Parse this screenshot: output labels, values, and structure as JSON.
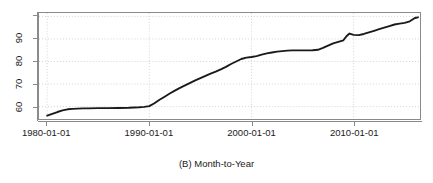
{
  "caption": "(B) Month-to-Year",
  "axis": {
    "y_ticks": [
      60,
      70,
      80,
      90
    ],
    "y_tick_labels": [
      "60",
      "70",
      "80",
      "90"
    ],
    "x_tick_labels": [
      "1980-01-01",
      "1990-01-01",
      "2000-01-01",
      "2010-01-01"
    ],
    "x_tick_values": [
      1980,
      1990,
      2000,
      2010
    ]
  },
  "chart_data": {
    "type": "line",
    "title": "",
    "subtitle": "",
    "xlabel": "(B) Month-to-Year",
    "ylabel": "",
    "grid": true,
    "legend": "none",
    "xlim": [
      1979.2,
      2016.5
    ],
    "ylim": [
      54.5,
      101.5
    ],
    "x_tick_labels": [
      "1980-01-01",
      "1990-01-01",
      "2000-01-01",
      "2010-01-01"
    ],
    "x_ticks": [
      1980,
      1990,
      2000,
      2010
    ],
    "y_ticks": [
      60,
      70,
      80,
      90
    ],
    "series": [
      {
        "name": "cumulative-percent",
        "color": "#1a1a1a",
        "x": [
          1980.0,
          1980.5,
          1981.0,
          1981.5,
          1982.0,
          1982.5,
          1983.0,
          1983.5,
          1984.0,
          1985.0,
          1986.0,
          1987.0,
          1988.0,
          1989.0,
          1989.5,
          1990.0,
          1990.5,
          1991.0,
          1991.5,
          1992.0,
          1992.5,
          1993.0,
          1993.5,
          1994.0,
          1994.5,
          1995.0,
          1995.5,
          1996.0,
          1996.5,
          1997.0,
          1997.5,
          1998.0,
          1998.5,
          1999.0,
          1999.5,
          2000.0,
          2000.5,
          2001.0,
          2001.5,
          2002.0,
          2002.5,
          2003.0,
          2003.5,
          2004.0,
          2004.5,
          2005.0,
          2005.5,
          2006.0,
          2006.5,
          2007.0,
          2007.5,
          2008.0,
          2008.5,
          2009.0,
          2009.3,
          2009.6,
          2010.0,
          2010.5,
          2011.0,
          2011.5,
          2012.0,
          2012.5,
          2013.0,
          2013.5,
          2014.0,
          2014.5,
          2015.0,
          2015.5,
          2016.0,
          2016.3
        ],
        "y": [
          56.0,
          56.8,
          57.6,
          58.3,
          58.8,
          59.0,
          59.1,
          59.2,
          59.2,
          59.3,
          59.3,
          59.4,
          59.5,
          59.7,
          59.9,
          60.2,
          61.5,
          63.0,
          64.4,
          65.8,
          67.1,
          68.3,
          69.4,
          70.5,
          71.6,
          72.6,
          73.6,
          74.6,
          75.5,
          76.5,
          77.6,
          78.9,
          80.0,
          81.1,
          81.7,
          82.0,
          82.4,
          83.0,
          83.6,
          84.0,
          84.4,
          84.6,
          84.8,
          84.9,
          84.9,
          84.9,
          84.9,
          85.0,
          85.2,
          86.0,
          87.0,
          88.0,
          88.7,
          89.4,
          91.2,
          92.4,
          91.8,
          91.7,
          92.2,
          92.9,
          93.6,
          94.3,
          95.0,
          95.7,
          96.4,
          96.8,
          97.1,
          97.8,
          99.3,
          99.6
        ]
      }
    ]
  }
}
